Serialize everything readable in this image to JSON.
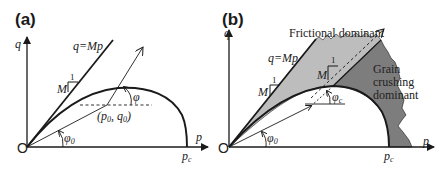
{
  "panels": [
    {
      "id": "a",
      "label": "(a)",
      "axes": {
        "x": "p",
        "y": "q",
        "origin": "O"
      },
      "line_label": "q=Mp",
      "slope_rise": "1",
      "slope_run": "M",
      "point_label": "(p",
      "point_sub0": "0",
      "point_mid": ", q",
      "point_sub1": "0",
      "point_close": ")",
      "angle_phi": "φ",
      "angle_phi0": "φ",
      "angle_phi0_sub": "0",
      "pc": "p",
      "pc_sub": "c"
    },
    {
      "id": "b",
      "label": "(b)",
      "axes": {
        "x": "p",
        "y": "q",
        "origin": "O"
      },
      "line_label": "q=Mp",
      "slope_rise": "1",
      "slope_run": "M",
      "slope2_rise": "1",
      "slope2_run": "M",
      "region_frictional": "Frictional dominant",
      "region_crushing_lines": [
        "Grain",
        "crushing",
        "dominant"
      ],
      "angle_phic": "φ",
      "angle_phic_sub": "c",
      "angle_phi0": "φ",
      "angle_phi0_sub": "0",
      "pc": "p",
      "pc_sub": "c"
    }
  ],
  "colors": {
    "line": "#1a1a1a",
    "frictional_fill": "#bdbdbd",
    "crushing_fill": "#7d7d7d"
  }
}
